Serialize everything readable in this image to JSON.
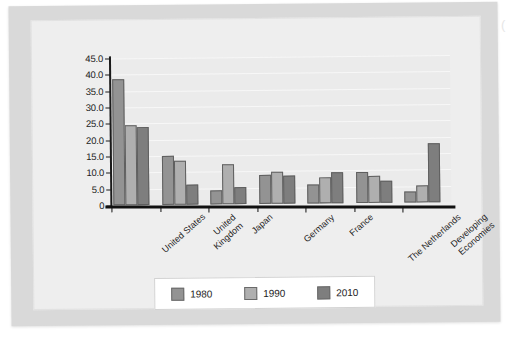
{
  "chart_data": {
    "type": "bar",
    "title": "",
    "xlabel": "",
    "ylabel": "",
    "ylim": [
      0,
      45
    ],
    "grid": true,
    "legend_position": "bottom",
    "categories": [
      "United States",
      "United Kingdom",
      "Japan",
      "Germany",
      "France",
      "The Netherlands",
      "Developing Economies"
    ],
    "ytick_labels": [
      "45.0",
      "40.0",
      "35.0",
      "30.0",
      "25.0",
      "20.0",
      "15.0",
      "10.0",
      "5.0",
      "0"
    ],
    "ytick_values": [
      45,
      40,
      35,
      30,
      25,
      20,
      15,
      10,
      5,
      0
    ],
    "series": [
      {
        "name": "1980",
        "color": "#939393",
        "values": [
          38.5,
          15.0,
          4.2,
          8.8,
          5.9,
          9.6,
          3.4
        ]
      },
      {
        "name": "1990",
        "color": "#afafaf",
        "values": [
          24.5,
          13.6,
          12.3,
          9.7,
          7.9,
          8.3,
          5.3
        ]
      },
      {
        "name": "2010",
        "color": "#7e7e7e",
        "values": [
          23.9,
          6.2,
          5.2,
          8.6,
          9.4,
          6.7,
          18.1
        ]
      }
    ]
  },
  "legend": {
    "items": [
      {
        "label": "1980",
        "color": "#939393"
      },
      {
        "label": "1990",
        "color": "#afafaf"
      },
      {
        "label": "2010",
        "color": "#7e7e7e"
      }
    ]
  },
  "page": {
    "edge_mark": "("
  }
}
